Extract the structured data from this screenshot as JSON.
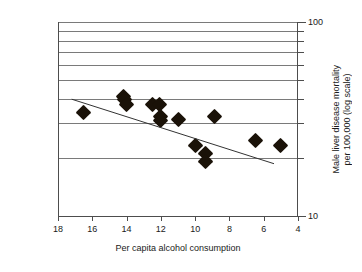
{
  "chart_data": {
    "type": "scatter",
    "title": "",
    "xlabel": "Per capita alcohol consumption",
    "ylabel": "Male liver disease mortality\nper 100,000 (log scale)",
    "x_ticks": [
      18,
      16,
      14,
      12,
      10,
      8,
      6,
      4
    ],
    "x_tick_labels": [
      "18",
      "16",
      "14",
      "12",
      "10",
      "8",
      "6",
      "4"
    ],
    "xlim": [
      18,
      4
    ],
    "x_axis_reversed": true,
    "y_ticks": [
      10,
      20,
      30,
      40,
      50,
      60,
      70,
      80,
      90,
      100
    ],
    "y_tick_labels_shown": [
      "100",
      "10"
    ],
    "ylim": [
      10,
      100
    ],
    "y_scale": "log",
    "y_axis_position": "right",
    "gridlines": {
      "horizontal": [
        20,
        30,
        40,
        50,
        60,
        70,
        80,
        90,
        100
      ],
      "vertical": []
    },
    "legend": null,
    "marker_shape": "diamond",
    "marker_color": "#1a1208",
    "trendline": {
      "visible": true,
      "color": "#333333",
      "x_start": 17.2,
      "y_start": 40.0,
      "x_end": 5.4,
      "y_end": 18.6
    },
    "points": [
      {
        "x": 16.5,
        "y": 34.0
      },
      {
        "x": 14.2,
        "y": 41.5
      },
      {
        "x": 14.1,
        "y": 40.0
      },
      {
        "x": 14.0,
        "y": 37.5
      },
      {
        "x": 12.5,
        "y": 37.5
      },
      {
        "x": 12.1,
        "y": 37.5
      },
      {
        "x": 12.0,
        "y": 32.5
      },
      {
        "x": 12.0,
        "y": 31.0
      },
      {
        "x": 11.0,
        "y": 31.5
      },
      {
        "x": 10.0,
        "y": 23.0
      },
      {
        "x": 9.4,
        "y": 21.0
      },
      {
        "x": 9.4,
        "y": 19.0
      },
      {
        "x": 8.9,
        "y": 32.5
      },
      {
        "x": 6.5,
        "y": 24.5
      },
      {
        "x": 5.0,
        "y": 23.0
      }
    ]
  },
  "axis": {
    "x_title": "Per capita alcohol consumption",
    "y_title_line1": "Male liver disease mortality",
    "y_title_line2": "per 100,000 (log scale)",
    "y_top_label": "100",
    "y_bottom_label": "10"
  }
}
